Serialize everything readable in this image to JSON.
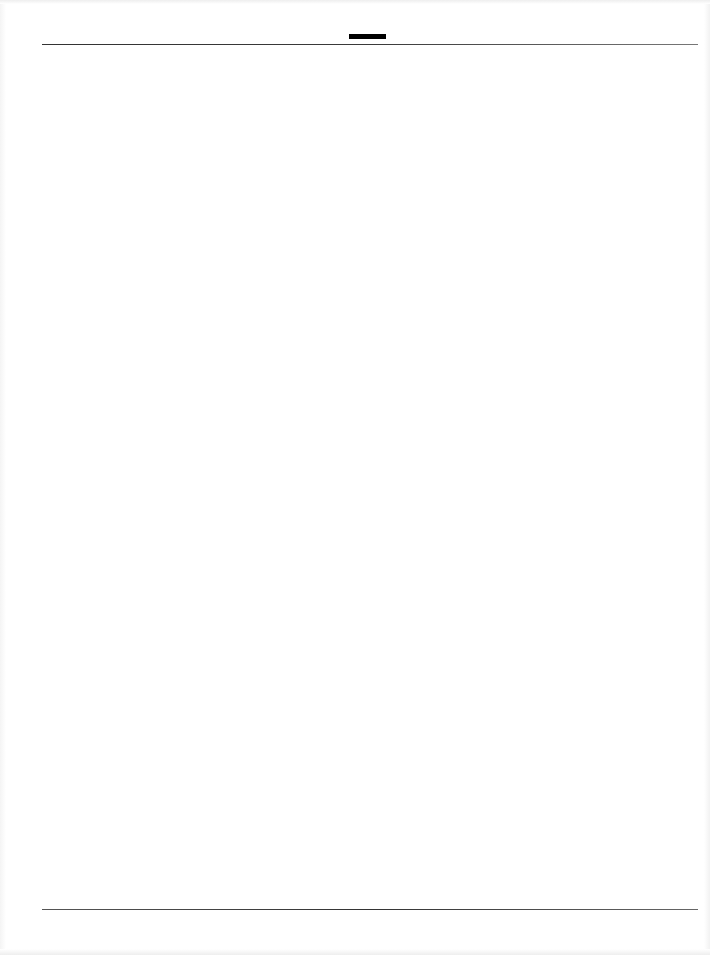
{
  "document": {
    "type": "blank-scanned-page",
    "header": {
      "mark": "redaction-bar",
      "mark_color": "#000000",
      "rule_color": "#333333"
    },
    "body": {
      "text": ""
    },
    "footer": {
      "rule_color": "#444444"
    }
  }
}
